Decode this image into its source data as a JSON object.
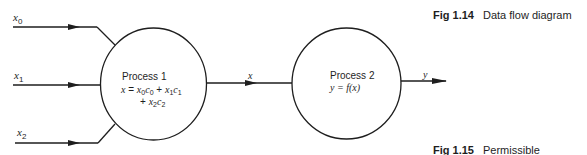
{
  "diagram": {
    "type": "data-flow",
    "inputs": [
      {
        "label": "x",
        "sub": "0"
      },
      {
        "label": "x",
        "sub": "1"
      },
      {
        "label": "x",
        "sub": "2"
      }
    ],
    "process1": {
      "title": "Process 1",
      "eq_line1": {
        "lhs": "x",
        "eq": " = ",
        "t1": "x",
        "t1s": "0",
        "t2": "c",
        "t2s": "0",
        "plus": " + ",
        "t3": "x",
        "t3s": "1",
        "t4": "c",
        "t4s": "1"
      },
      "eq_line2": {
        "plus": "+ ",
        "t1": "x",
        "t1s": "2",
        "t2": "c",
        "t2s": "2"
      }
    },
    "intermediate": {
      "label": "x"
    },
    "process2": {
      "title": "Process 2",
      "eq": {
        "lhs": "y",
        "rest": " = f(x)"
      }
    },
    "output": {
      "label": "y"
    },
    "colors": {
      "stroke": "#1e1e1e",
      "background": "#ffffff"
    }
  },
  "captions": [
    {
      "fig": "Fig 1.14",
      "text": "Data flow diagram"
    },
    {
      "fig": "Fig 1.15",
      "text": "Permissible"
    }
  ]
}
